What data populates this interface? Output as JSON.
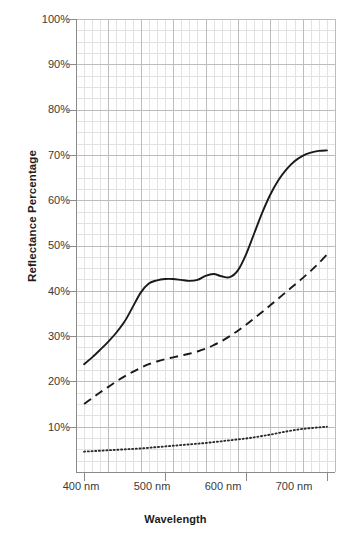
{
  "chart_data": {
    "type": "line",
    "title": "",
    "xlabel": "Wavelength",
    "ylabel": "Reflectance Percentage",
    "xlim": [
      390,
      710
    ],
    "ylim": [
      0,
      100
    ],
    "grid": true,
    "legend": "none",
    "xticks": [
      "400 nm",
      "500 nm",
      "600 nm",
      "700 nm"
    ],
    "xtick_values": [
      400,
      500,
      600,
      700
    ],
    "yticks": [
      "10%",
      "20%",
      "30%",
      "40%",
      "50%",
      "60%",
      "70%",
      "80%",
      "90%",
      "100%"
    ],
    "ytick_values": [
      10,
      20,
      30,
      40,
      50,
      60,
      70,
      80,
      90,
      100
    ],
    "x": [
      400,
      410,
      420,
      430,
      440,
      450,
      460,
      470,
      480,
      490,
      500,
      510,
      520,
      530,
      540,
      550,
      560,
      570,
      580,
      590,
      600,
      610,
      620,
      630,
      640,
      650,
      660,
      670,
      680,
      690,
      700
    ],
    "series": [
      {
        "name": "solid-curve",
        "style": "solid",
        "color": "#1a1a1a",
        "values": [
          23.8,
          25.3,
          27.0,
          28.8,
          30.8,
          33.2,
          36.4,
          39.6,
          41.6,
          42.3,
          42.6,
          42.6,
          42.4,
          42.2,
          42.4,
          43.3,
          43.7,
          43.2,
          43.0,
          44.5,
          48.0,
          52.6,
          57.2,
          61.2,
          64.4,
          66.8,
          68.6,
          69.8,
          70.5,
          70.9,
          71.0
        ]
      },
      {
        "name": "dashed-curve",
        "style": "dashed",
        "color": "#1a1a1a",
        "values": [
          15.0,
          16.3,
          17.6,
          18.8,
          20.0,
          21.1,
          22.1,
          23.0,
          23.8,
          24.4,
          24.9,
          25.3,
          25.7,
          26.1,
          26.6,
          27.2,
          28.0,
          28.9,
          30.0,
          31.2,
          32.5,
          33.9,
          35.3,
          36.8,
          38.3,
          39.8,
          41.3,
          42.8,
          44.4,
          46.1,
          48.0
        ]
      },
      {
        "name": "dotted-curve",
        "style": "dotted",
        "color": "#2a2a2a",
        "values": [
          4.5,
          4.6,
          4.7,
          4.8,
          4.9,
          5.0,
          5.1,
          5.2,
          5.35,
          5.5,
          5.65,
          5.8,
          5.95,
          6.1,
          6.25,
          6.4,
          6.6,
          6.8,
          7.0,
          7.2,
          7.4,
          7.65,
          7.95,
          8.25,
          8.6,
          8.95,
          9.25,
          9.5,
          9.7,
          9.85,
          10.0
        ]
      }
    ]
  },
  "axes": {
    "y_axis_label": "Reflectance Percentage",
    "x_axis_label": "Wavelength"
  },
  "colors": {
    "grid_minor": "#e2e2e2",
    "grid_major": "#bdbdbd",
    "axis": "#8a8a8a",
    "curve": "#1a1a1a",
    "tick_text": "#3a3a3a",
    "label_text": "#1c1c1c"
  }
}
